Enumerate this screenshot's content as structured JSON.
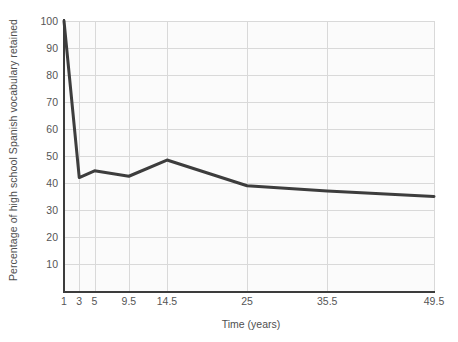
{
  "chart_data": {
    "type": "line",
    "title": "",
    "xlabel": "Time (years)",
    "ylabel": "Percentage of high school Spanish vocabulary retained",
    "x": [
      1,
      3,
      5,
      9.5,
      14.5,
      25,
      35.5,
      49.5
    ],
    "values": [
      100,
      42,
      44.5,
      42.5,
      48.5,
      39,
      37,
      35
    ],
    "xtick_labels": [
      "1",
      "3",
      "5",
      "9.5",
      "14.5",
      "25",
      "35.5",
      "49.5"
    ],
    "ytick_labels": [
      "10",
      "20",
      "30",
      "40",
      "50",
      "60",
      "70",
      "80",
      "90",
      "100"
    ],
    "yticks": [
      10,
      20,
      30,
      40,
      50,
      60,
      70,
      80,
      90,
      100
    ],
    "ylim": [
      0,
      100
    ],
    "xlim": [
      1,
      49.5
    ],
    "grid": true,
    "legend": "none",
    "series_name": "Percentage retained",
    "line_color": "#3d3d3d",
    "grid_color": "#d9d9d9",
    "axis_color": "#3c3c3c",
    "plot_background": "#fbfbfb",
    "figure_background": "#ffffff",
    "text_color": "#555555",
    "line_width": 3
  }
}
